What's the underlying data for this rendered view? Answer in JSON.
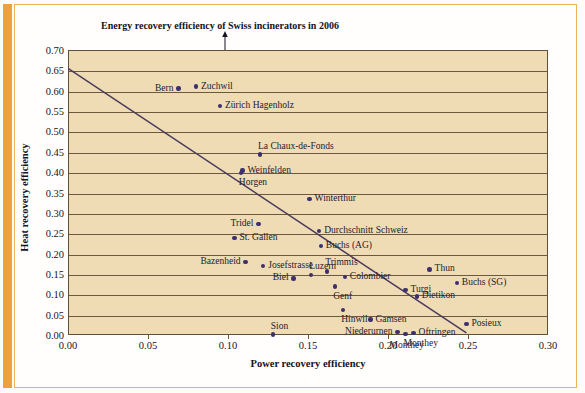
{
  "chart_data": {
    "type": "scatter",
    "title": "Energy recovery efficiency of Swiss incinerators in 2006",
    "xlabel": "Power recovery efficiency",
    "ylabel": "Heat recovery efficiency",
    "xlim": [
      0.0,
      0.3
    ],
    "ylim": [
      0.0,
      0.7
    ],
    "xticks": [
      "0.00",
      "0.05",
      "0.10",
      "0.15",
      "0.20",
      "0.25",
      "0.30"
    ],
    "xtick_values": [
      0.0,
      0.05,
      0.1,
      0.15,
      0.2,
      0.25,
      0.3
    ],
    "yticks": [
      "0.00",
      "0.05",
      "0.10",
      "0.15",
      "0.20",
      "0.25",
      "0.30",
      "0.35",
      "0.40",
      "0.45",
      "0.50",
      "0.55",
      "0.60",
      "0.65",
      "0.70"
    ],
    "ytick_values": [
      0.0,
      0.05,
      0.1,
      0.15,
      0.2,
      0.25,
      0.3,
      0.35,
      0.4,
      0.45,
      0.5,
      0.55,
      0.6,
      0.65,
      0.7
    ],
    "grid": true,
    "legend": "none",
    "point_color": "#3b2f6e",
    "plot_background": "#efdcb4",
    "trendline": {
      "label": "reference line",
      "color": "#4a3a5e",
      "x0": 0.0,
      "y0": 0.655,
      "x1": 0.249,
      "y1": 0.005
    },
    "points": [
      {
        "label": "Bern",
        "x": 0.069,
        "y": 0.605,
        "label_side": "left"
      },
      {
        "label": "Zuchwil",
        "x": 0.08,
        "y": 0.61,
        "label_side": "right"
      },
      {
        "label": "Zürich Hagenholz",
        "x": 0.095,
        "y": 0.562,
        "label_side": "right"
      },
      {
        "label": "La Chaux-de-Fonds",
        "x": 0.12,
        "y": 0.443,
        "label_side": "above"
      },
      {
        "label": "Weinfelden",
        "x": 0.109,
        "y": 0.404,
        "label_side": "right"
      },
      {
        "label": "Horgen",
        "x": 0.108,
        "y": 0.398,
        "label_side": "below"
      },
      {
        "label": "Winterthur",
        "x": 0.151,
        "y": 0.334,
        "label_side": "right"
      },
      {
        "label": "Durchschnitt Schweiz",
        "x": 0.157,
        "y": 0.256,
        "label_side": "right"
      },
      {
        "label": "Tridel",
        "x": 0.119,
        "y": 0.272,
        "label_side": "left"
      },
      {
        "label": "St. Gallen",
        "x": 0.104,
        "y": 0.239,
        "label_side": "right"
      },
      {
        "label": "Buchs (AG)",
        "x": 0.158,
        "y": 0.218,
        "label_side": "right"
      },
      {
        "label": "Bazenheid",
        "x": 0.111,
        "y": 0.18,
        "label_side": "left"
      },
      {
        "label": "Josefstrasse",
        "x": 0.122,
        "y": 0.17,
        "label_side": "right"
      },
      {
        "label": "Trimmis",
        "x": 0.162,
        "y": 0.156,
        "label_side": "above"
      },
      {
        "label": "Thun",
        "x": 0.226,
        "y": 0.161,
        "label_side": "right"
      },
      {
        "label": "Biel",
        "x": 0.141,
        "y": 0.139,
        "label_side": "left"
      },
      {
        "label": "Luzern",
        "x": 0.152,
        "y": 0.147,
        "label_side": "above"
      },
      {
        "label": "Colombier",
        "x": 0.173,
        "y": 0.142,
        "label_side": "right"
      },
      {
        "label": "Buchs (SG)",
        "x": 0.243,
        "y": 0.128,
        "label_side": "right"
      },
      {
        "label": "Turgi",
        "x": 0.211,
        "y": 0.11,
        "label_side": "right"
      },
      {
        "label": "Genf",
        "x": 0.167,
        "y": 0.119,
        "label_side": "below"
      },
      {
        "label": "Dietikon",
        "x": 0.218,
        "y": 0.095,
        "label_side": "right"
      },
      {
        "label": "Hinwil",
        "x": 0.172,
        "y": 0.062,
        "label_side": "below"
      },
      {
        "label": "Gamsen",
        "x": 0.189,
        "y": 0.038,
        "label_side": "right"
      },
      {
        "label": "Posieux",
        "x": 0.249,
        "y": 0.027,
        "label_side": "right"
      },
      {
        "label": "Sion",
        "x": 0.128,
        "y": 0.001,
        "label_side": "above"
      },
      {
        "label": "Niederurnen",
        "x": 0.206,
        "y": 0.007,
        "label_side": "left"
      },
      {
        "label": "Oftringen",
        "x": 0.216,
        "y": 0.005,
        "label_side": "right"
      },
      {
        "label": "Monthey",
        "x": 0.211,
        "y": 0.0,
        "label_side": "axis"
      }
    ]
  }
}
